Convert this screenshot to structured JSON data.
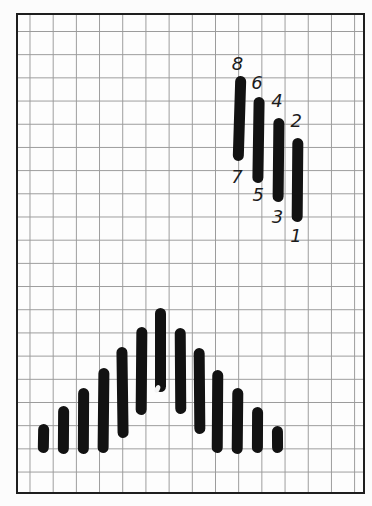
{
  "colors": {
    "page_background": "#fcfcfc",
    "canvas_background": "#fdfdfd",
    "frame_border": "#1e1e1e",
    "grid_line": "#9a9a9a",
    "stitch": "#121212",
    "label": "#1c1c1c",
    "speck": "#f4f4f4"
  },
  "canvas": {
    "left": 15.5,
    "top": 13,
    "width": 349.5,
    "height": 481,
    "border_width": 2.5,
    "grid_spacing_x": 23.2,
    "grid_spacing_y": 23.2,
    "grid_offset_x": 11.5,
    "grid_offset_y": 16
  },
  "numbered_stitch_width": 10.8,
  "pyramid_stitch_width": 10.6,
  "numbered_stitches": [
    {
      "x": 239,
      "y_top": 76,
      "y_bottom": 160.5,
      "tilt": 1.8,
      "top_label": {
        "text": "8",
        "x": 237.5,
        "y": 63.5
      },
      "bottom_label": {
        "text": "7",
        "x": 237,
        "y": 176.5
      }
    },
    {
      "x": 258.3,
      "y_top": 96.5,
      "y_bottom": 182,
      "tilt": 0.9,
      "top_label": {
        "text": "6",
        "x": 257,
        "y": 83
      },
      "bottom_label": {
        "text": "5",
        "x": 258.3,
        "y": 195
      }
    },
    {
      "x": 278,
      "y_top": 117.5,
      "y_bottom": 201,
      "tilt": 0.6,
      "top_label": {
        "text": "4",
        "x": 277,
        "y": 101.3
      },
      "bottom_label": {
        "text": "3",
        "x": 277.5,
        "y": 216.5
      }
    },
    {
      "x": 297.8,
      "y_top": 138,
      "y_bottom": 222,
      "tilt": 0.5,
      "top_label": {
        "text": "2",
        "x": 296.3,
        "y": 120.5
      },
      "bottom_label": {
        "text": "1",
        "x": 296,
        "y": 236
      }
    }
  ],
  "pyramid_stitches": [
    {
      "x": 43.3,
      "y_top": 423.5,
      "y_bottom": 452.5,
      "tilt": 1.0
    },
    {
      "x": 63.3,
      "y_top": 405.5,
      "y_bottom": 453.5,
      "tilt": 0.4
    },
    {
      "x": 83.3,
      "y_top": 387.5,
      "y_bottom": 453,
      "tilt": 0.3
    },
    {
      "x": 103.3,
      "y_top": 367.5,
      "y_bottom": 452.5,
      "tilt": 0.6
    },
    {
      "x": 122.0,
      "y_top": 346.5,
      "y_bottom": 437,
      "tilt": -0.8
    },
    {
      "x": 141.7,
      "y_top": 326.5,
      "y_bottom": 414.5,
      "tilt": 0.5
    },
    {
      "x": 160.7,
      "y_top": 308,
      "y_bottom": 392,
      "tilt": 0
    },
    {
      "x": 180.0,
      "y_top": 327.5,
      "y_bottom": 413.5,
      "tilt": -0.4
    },
    {
      "x": 199.3,
      "y_top": 348,
      "y_bottom": 434,
      "tilt": -0.5
    },
    {
      "x": 217.5,
      "y_top": 369.5,
      "y_bottom": 452.5,
      "tilt": 0.4
    },
    {
      "x": 237.3,
      "y_top": 388.3,
      "y_bottom": 454,
      "tilt": 0.6
    },
    {
      "x": 257.0,
      "y_top": 407.3,
      "y_bottom": 453.5,
      "tilt": 0.3
    },
    {
      "x": 277.0,
      "y_top": 426,
      "y_bottom": 452.5,
      "tilt": -0.4
    }
  ],
  "print_speck": {
    "x": 157.5,
    "y": 389,
    "width": 5,
    "height": 7.5,
    "angle": 25
  }
}
